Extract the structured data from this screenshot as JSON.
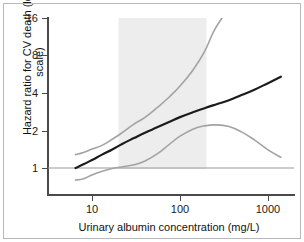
{
  "figure": {
    "background_color": "#ffffff",
    "border_color": "#b9b9b9"
  },
  "axis": {
    "y_title": "Hazard ratio for CV death (log scale)",
    "x_title": "Urinary albumin concentration (mg/L)",
    "y_ticks": [
      "1",
      "2",
      "4",
      "8",
      "16"
    ],
    "x_ticks": [
      "10",
      "100",
      "1000"
    ]
  },
  "chart_data": {
    "type": "line",
    "title": "",
    "subtitle": "",
    "xlabel": "Urinary albumin concentration (mg/L)",
    "ylabel": "Hazard ratio for CV death (log scale)",
    "xscale": "log",
    "yscale": "log",
    "xlim": [
      5,
      2000
    ],
    "ylim": [
      0.72,
      16
    ],
    "xticks": [
      10,
      100,
      1000
    ],
    "xticklabels": [
      "10",
      "100",
      "1000"
    ],
    "yticks": [
      1,
      2,
      4,
      8,
      16
    ],
    "yticklabels": [
      "1",
      "2",
      "4",
      "8",
      "16"
    ],
    "grid": false,
    "legend": "none",
    "reference_line": {
      "y": 1,
      "color": "#9a9a9a",
      "label": "null effect (HR = 1)"
    },
    "shaded_band": {
      "label": "microalbuminuria range",
      "x_start": 20,
      "x_end": 200,
      "color": "#ededed"
    },
    "series": [
      {
        "name": "Hazard ratio (point estimate)",
        "color": "#1c1c1c",
        "linewidth": 2.2,
        "x": [
          6.5,
          8,
          10,
          13,
          17,
          22,
          30,
          40,
          55,
          75,
          100,
          140,
          190,
          260,
          360,
          500,
          700,
          1000,
          1400
        ],
        "y": [
          1.0,
          1.07,
          1.16,
          1.28,
          1.41,
          1.56,
          1.74,
          1.92,
          2.12,
          2.34,
          2.56,
          2.8,
          3.02,
          3.25,
          3.5,
          3.85,
          4.25,
          4.8,
          5.4
        ]
      },
      {
        "name": "Upper 95% confidence limit",
        "color": "#a3a3a3",
        "linewidth": 1.6,
        "x": [
          6.5,
          8,
          10,
          13,
          17,
          22,
          30,
          40,
          55,
          75,
          100,
          140,
          190,
          240,
          300
        ],
        "y": [
          1.28,
          1.33,
          1.42,
          1.52,
          1.7,
          1.92,
          2.25,
          2.55,
          3.05,
          3.7,
          4.55,
          6.1,
          8.6,
          12.4,
          16.0
        ]
      },
      {
        "name": "Lower 95% confidence limit",
        "color": "#a3a3a3",
        "linewidth": 1.6,
        "x": [
          6.5,
          8,
          10,
          13,
          17,
          22,
          30,
          40,
          55,
          75,
          100,
          140,
          190,
          260,
          360,
          500,
          700,
          1000,
          1400
        ],
        "y": [
          0.8,
          0.82,
          0.88,
          0.94,
          0.99,
          1.02,
          1.06,
          1.14,
          1.3,
          1.54,
          1.8,
          2.05,
          2.18,
          2.22,
          2.15,
          1.95,
          1.68,
          1.4,
          1.22
        ]
      }
    ]
  }
}
